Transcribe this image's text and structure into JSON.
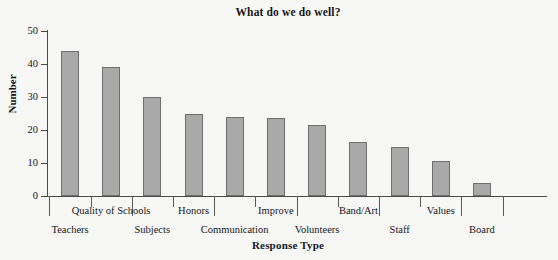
{
  "chart_data": {
    "type": "bar",
    "title": "What do we do well?",
    "xlabel": "Response Type",
    "ylabel": "Number",
    "categories": [
      "Teachers",
      "Quality of Schools",
      "Subjects",
      "Honors",
      "Communication",
      "Improve",
      "Volunteers",
      "Band/Art",
      "Staff",
      "Values",
      "Board"
    ],
    "values": [
      44,
      39,
      30,
      25,
      24,
      23.5,
      21.5,
      16.5,
      15,
      10.5,
      4
    ],
    "ylim": [
      0,
      50
    ],
    "yticks": [
      0,
      10,
      20,
      30,
      40,
      50
    ],
    "ytick_labels": [
      "0",
      "10",
      "20",
      "30",
      "40",
      "50"
    ],
    "grid": false,
    "legend": false,
    "bar_color": "#a9a9a9",
    "bar_border_color": "#6e6e6e",
    "axis_color": "#4b4b4b",
    "background_color": "#f7f7f5",
    "label_rows": [
      2,
      1,
      2,
      1,
      2,
      1,
      2,
      1,
      2,
      1,
      2
    ]
  }
}
